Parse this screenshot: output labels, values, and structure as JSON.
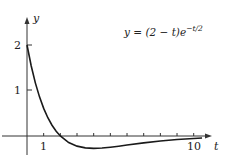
{
  "chart_data": {
    "type": "line",
    "title": "",
    "annotation": "y = (2 − t)e^{−t/2}",
    "formula": {
      "lhs": "y = (2 − t)e",
      "exponent": "−t/2"
    },
    "xlabel": "t",
    "ylabel": "y",
    "xlim": [
      -0.5,
      11
    ],
    "ylim": [
      -0.5,
      2.6
    ],
    "x_tick_labels": [
      "1",
      "10"
    ],
    "y_tick_labels": [
      "1",
      "2"
    ],
    "x_minor_ticks": [
      1,
      2,
      3,
      4,
      5,
      6,
      7,
      8,
      9,
      10
    ],
    "grid": false,
    "legend": null,
    "series": [
      {
        "name": "y = (2 − t)e^{−t/2}",
        "x": [
          0,
          0.25,
          0.5,
          0.75,
          1,
          1.25,
          1.5,
          1.75,
          2,
          2.5,
          3,
          3.5,
          4,
          4.5,
          5,
          5.5,
          6,
          7,
          8,
          9,
          10,
          10.5
        ],
        "y": [
          2.0,
          1.544,
          1.168,
          0.86,
          0.607,
          0.401,
          0.236,
          0.104,
          0.0,
          -0.143,
          -0.223,
          -0.261,
          -0.271,
          -0.264,
          -0.246,
          -0.224,
          -0.199,
          -0.151,
          -0.11,
          -0.078,
          -0.054,
          -0.045
        ]
      }
    ]
  },
  "labels": {
    "y_axis": "y",
    "x_axis": "t",
    "tick_y2": "2",
    "tick_y1": "1",
    "tick_x1": "1",
    "tick_x10": "10"
  },
  "colors": {
    "curve": "#1a1a1a",
    "axes": "#333333",
    "text": "#222222"
  }
}
